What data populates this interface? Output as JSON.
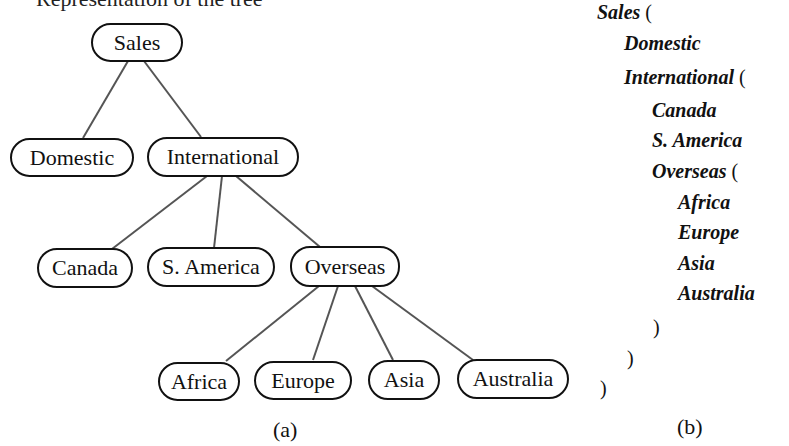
{
  "top_text_fragment": "Representation of the tree",
  "tree": {
    "nodes": {
      "sales": "Sales",
      "domestic": "Domestic",
      "international": "International",
      "canada": "Canada",
      "s_america": "S. America",
      "overseas": "Overseas",
      "africa": "Africa",
      "europe": "Europe",
      "asia": "Asia",
      "australia": "Australia"
    },
    "caption": "(a)"
  },
  "nested": {
    "lines": [
      {
        "name": "Sales",
        "open": " (",
        "indent": 0
      },
      {
        "name": "Domestic",
        "open": "",
        "indent": 1
      },
      {
        "name": "International",
        "open": " (",
        "indent": 1
      },
      {
        "name": "Canada",
        "open": "",
        "indent": 2
      },
      {
        "name": "S. America",
        "open": "",
        "indent": 2
      },
      {
        "name": "Overseas",
        "open": " (",
        "indent": 2
      },
      {
        "name": "Africa",
        "open": "",
        "indent": 3
      },
      {
        "name": "Europe",
        "open": "",
        "indent": 3
      },
      {
        "name": "Asia",
        "open": "",
        "indent": 3
      },
      {
        "name": "Australia",
        "open": "",
        "indent": 3
      }
    ],
    "closers": [
      ")",
      ")",
      ")"
    ],
    "caption": "(b)"
  }
}
